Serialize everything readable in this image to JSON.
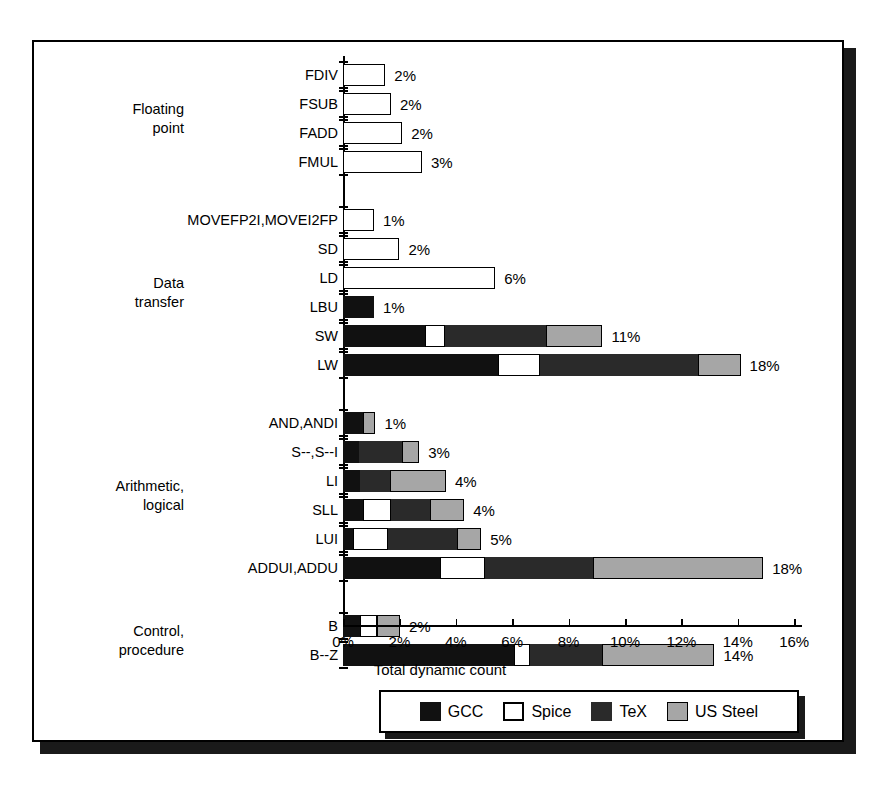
{
  "chart_data": {
    "type": "bar",
    "orientation": "horizontal",
    "stacked": true,
    "title": "",
    "xlabel": "Total dynamic count",
    "ylabel": "",
    "xlim": [
      0,
      16
    ],
    "xtick_labels": [
      "0%",
      "2%",
      "4%",
      "6%",
      "8%",
      "10%",
      "12%",
      "14%",
      "16%"
    ],
    "xtick_values": [
      0,
      2,
      4,
      6,
      8,
      10,
      12,
      14,
      16
    ],
    "grid": false,
    "legend_position": "bottom",
    "legend": [
      "GCC",
      "Spice",
      "TeX",
      "US Steel"
    ],
    "series_colors": {
      "GCC": "#111111",
      "Spice": "#ffffff",
      "TeX": "#2a2a2a",
      "US Steel": "#a6a6a6"
    },
    "groups": [
      {
        "name": "Floating\npoint",
        "rows": [
          {
            "label": "FDIV",
            "value_label": "2%",
            "segments": {
              "GCC": 0,
              "Spice": 1.5,
              "TeX": 0,
              "US Steel": 0
            },
            "total": 1.5
          },
          {
            "label": "FSUB",
            "value_label": "2%",
            "segments": {
              "GCC": 0,
              "Spice": 1.7,
              "TeX": 0,
              "US Steel": 0
            },
            "total": 1.7
          },
          {
            "label": "FADD",
            "value_label": "2%",
            "segments": {
              "GCC": 0,
              "Spice": 2.1,
              "TeX": 0,
              "US Steel": 0
            },
            "total": 2.1
          },
          {
            "label": "FMUL",
            "value_label": "3%",
            "segments": {
              "GCC": 0,
              "Spice": 2.8,
              "TeX": 0,
              "US Steel": 0
            },
            "total": 2.8
          }
        ]
      },
      {
        "name": "Data\ntransfer",
        "rows": [
          {
            "label": "MOVEFP2I,MOVEI2FP",
            "value_label": "1%",
            "segments": {
              "GCC": 0,
              "Spice": 1.1,
              "TeX": 0,
              "US Steel": 0
            },
            "total": 1.1
          },
          {
            "label": "SD",
            "value_label": "2%",
            "segments": {
              "GCC": 0,
              "Spice": 2.0,
              "TeX": 0,
              "US Steel": 0
            },
            "total": 2.0
          },
          {
            "label": "LD",
            "value_label": "6%",
            "segments": {
              "GCC": 0,
              "Spice": 5.4,
              "TeX": 0,
              "US Steel": 0
            },
            "total": 5.4
          },
          {
            "label": "LBU",
            "value_label": "1%",
            "segments": {
              "GCC": 1.1,
              "Spice": 0,
              "TeX": 0,
              "US Steel": 0
            },
            "total": 1.1
          },
          {
            "label": "SW",
            "value_label": "11%",
            "segments": {
              "GCC": 2.9,
              "Spice": 0.7,
              "TeX": 3.6,
              "US Steel": 2.0
            },
            "total": 9.2
          },
          {
            "label": "LW",
            "value_label": "18%",
            "segments": {
              "GCC": 5.5,
              "Spice": 1.5,
              "TeX": 5.6,
              "US Steel": 1.5
            },
            "total": 14.1
          }
        ]
      },
      {
        "name": "Arithmetic,\nlogical",
        "rows": [
          {
            "label": "AND,ANDI",
            "value_label": "1%",
            "segments": {
              "GCC": 0.7,
              "Spice": 0,
              "TeX": 0,
              "US Steel": 0.45
            },
            "total": 1.15
          },
          {
            "label": "S--,S--I",
            "value_label": "3%",
            "segments": {
              "GCC": 0.55,
              "Spice": 0,
              "TeX": 1.55,
              "US Steel": 0.6
            },
            "total": 2.7
          },
          {
            "label": "LI",
            "value_label": "4%",
            "segments": {
              "GCC": 0.6,
              "Spice": 0,
              "TeX": 1.05,
              "US Steel": 2.0
            },
            "total": 3.65
          },
          {
            "label": "SLL",
            "value_label": "4%",
            "segments": {
              "GCC": 0.7,
              "Spice": 1.0,
              "TeX": 1.4,
              "US Steel": 1.2
            },
            "total": 4.3
          },
          {
            "label": "LUI",
            "value_label": "5%",
            "segments": {
              "GCC": 0.35,
              "Spice": 1.25,
              "TeX": 2.45,
              "US Steel": 0.85
            },
            "total": 4.9
          },
          {
            "label": "ADDUI,ADDU",
            "value_label": "18%",
            "segments": {
              "GCC": 3.45,
              "Spice": 1.6,
              "TeX": 3.8,
              "US Steel": 6.05
            },
            "total": 14.9
          }
        ]
      },
      {
        "name": "Control,\nprocedure",
        "rows": [
          {
            "label": "B",
            "value_label": "2%",
            "segments": {
              "GCC": 0.6,
              "Spice": 0.6,
              "TeX": 0,
              "US Steel": 0.82
            },
            "total": 2.02
          },
          {
            "label": "B--Z",
            "value_label": "14%",
            "segments": {
              "GCC": 6.05,
              "Spice": 0.57,
              "TeX": 2.55,
              "US Steel": 4.0
            },
            "total": 13.17
          }
        ]
      }
    ]
  }
}
